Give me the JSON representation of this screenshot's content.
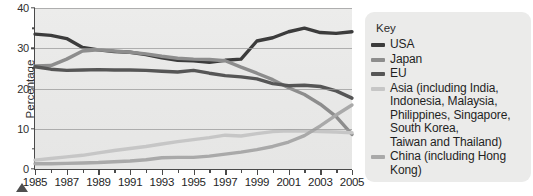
{
  "chart_data": {
    "type": "line",
    "title": "",
    "xlabel": "",
    "ylabel": "Percentage",
    "grid": true,
    "legend_position": "right",
    "xlim": [
      1985,
      2005
    ],
    "ylim": [
      0,
      40
    ],
    "y_ticks": [
      0,
      10,
      20,
      30,
      40
    ],
    "y_minor_ticks": [
      5,
      15,
      25,
      35
    ],
    "x_ticks": [
      1985,
      1987,
      1989,
      1991,
      1993,
      1995,
      1997,
      1999,
      2001,
      2003,
      2005
    ],
    "x": [
      1985,
      1986,
      1987,
      1988,
      1989,
      1990,
      1991,
      1992,
      1993,
      1994,
      1995,
      1996,
      1997,
      1998,
      1999,
      2000,
      2001,
      2002,
      2003,
      2004,
      2005
    ],
    "series": [
      {
        "name": "USA",
        "color": "#3c3c3c",
        "values": [
          33.5,
          33.2,
          32.4,
          30.2,
          29.6,
          29.2,
          29.0,
          28.4,
          27.6,
          27.0,
          26.9,
          26.5,
          27.0,
          27.3,
          31.8,
          32.6,
          34.1,
          35.0,
          33.9,
          33.7,
          34.1
        ]
      },
      {
        "name": "Japan",
        "color": "#8d8d8d",
        "values": [
          25.6,
          25.7,
          27.3,
          29.3,
          29.6,
          29.3,
          29.0,
          28.6,
          28.0,
          27.5,
          27.3,
          27.2,
          26.9,
          25.3,
          23.8,
          22.2,
          20.2,
          18.5,
          16.1,
          13.0,
          8.6
        ]
      },
      {
        "name": "EU",
        "color": "#565656",
        "values": [
          25.4,
          24.8,
          24.5,
          24.6,
          24.7,
          24.6,
          24.6,
          24.5,
          24.3,
          24.1,
          24.5,
          23.8,
          23.2,
          22.9,
          22.4,
          21.2,
          20.7,
          20.8,
          20.5,
          19.4,
          17.6
        ]
      },
      {
        "name": "Asia (including India,\nIndonesia, Malaysia,\nPhilippines, Singapore,\nSouth Korea,\nTaiwan and Thailand)",
        "color": "#c6c6c6",
        "values": [
          2.2,
          2.6,
          3.0,
          3.4,
          4.0,
          4.6,
          5.1,
          5.6,
          6.2,
          6.8,
          7.3,
          7.8,
          8.4,
          8.2,
          8.8,
          9.3,
          9.5,
          9.4,
          9.3,
          9.2,
          9.0
        ]
      },
      {
        "name": "China (including Hong Kong)",
        "color": "#a9a9a9",
        "values": [
          1.3,
          1.3,
          1.4,
          1.5,
          1.6,
          1.8,
          2.0,
          2.3,
          2.8,
          2.9,
          2.9,
          3.2,
          3.7,
          4.2,
          4.8,
          5.6,
          6.7,
          8.3,
          10.7,
          13.4,
          15.9
        ]
      }
    ]
  },
  "legend": {
    "title": "Key",
    "items": [
      {
        "label": "USA",
        "color": "#3c3c3c"
      },
      {
        "label": "Japan",
        "color": "#8d8d8d"
      },
      {
        "label": "EU",
        "color": "#565656"
      },
      {
        "label": "Asia (including India,\nIndonesia, Malaysia,\nPhilippines, Singapore,\nSouth Korea,\nTaiwan and Thailand)",
        "color": "#c6c6c6"
      },
      {
        "label": "China (including Hong Kong)",
        "color": "#a9a9a9"
      }
    ]
  }
}
